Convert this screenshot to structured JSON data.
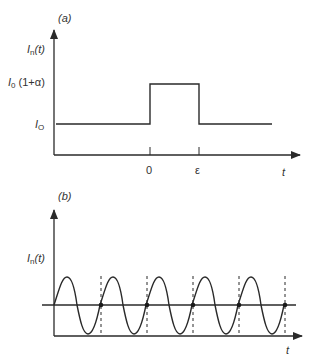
{
  "panel_a": {
    "label": "(a)",
    "y_label_main": "I",
    "y_label_sub": "n",
    "y_label_arg": "(t)",
    "level_high_main": "I",
    "level_high_sub": "0",
    "level_high_factor": " (1+α)",
    "level_low_main": "I",
    "level_low_sub": "O",
    "tick_0": "0",
    "tick_eps": "ε",
    "x_label": "t"
  },
  "panel_b": {
    "label": "(b)",
    "y_label_main": "I",
    "y_label_sub": "n",
    "y_label_arg": "(t)",
    "x_label": "t"
  },
  "colors": {
    "stroke": "#2a2a2a",
    "text": "#333333"
  }
}
